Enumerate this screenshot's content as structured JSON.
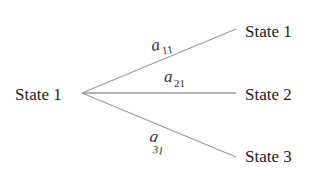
{
  "diagram": {
    "type": "tree",
    "colors": {
      "edge": "#9a9a9a",
      "text": "#222222"
    },
    "root": {
      "label": "State 1"
    },
    "branches": [
      {
        "target": "State 1",
        "prob_var": "a",
        "prob_sub": "11"
      },
      {
        "target": "State 2",
        "prob_var": "a",
        "prob_sub": "21"
      },
      {
        "target": "State 3",
        "prob_var": "a",
        "prob_sub": "31"
      }
    ]
  }
}
